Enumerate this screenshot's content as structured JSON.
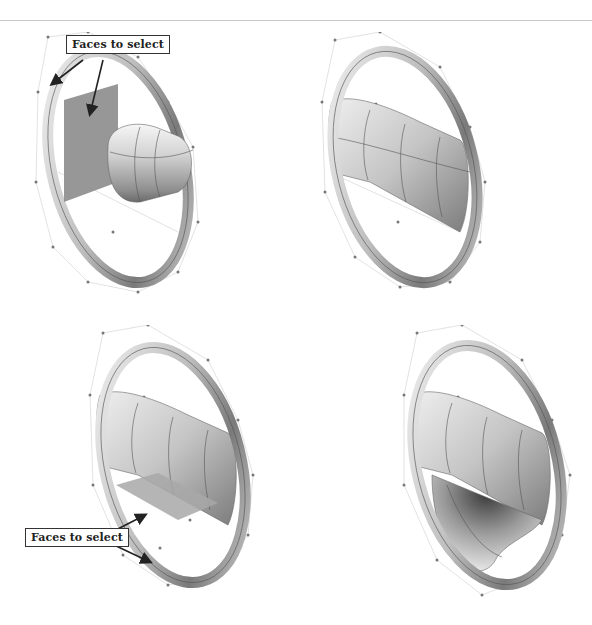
{
  "page": {
    "type": "book figure page",
    "panels": [
      {
        "id": "top-left",
        "description": "Steering wheel rim with vertical planar patch and cylindrical hub; two faces highlighted",
        "callout": "Faces to select"
      },
      {
        "id": "top-right",
        "description": "Steering wheel with hub blended into rim (upper spoke surface)"
      },
      {
        "id": "bottom-left",
        "description": "Steering wheel with upper spoke surface and lower planar patch highlighted",
        "callout": "Faces to select"
      },
      {
        "id": "bottom-right",
        "description": "Steering wheel with lower spoke surface blended into rim"
      }
    ]
  },
  "callouts": {
    "top_left": "Faces to select",
    "bottom_left": "Faces to select"
  },
  "colors": {
    "background": "#ffffff",
    "rule": "#c8c8c8",
    "callout_border": "#333333",
    "selected_face": "#8c8c8c",
    "arrow": "#222222"
  }
}
